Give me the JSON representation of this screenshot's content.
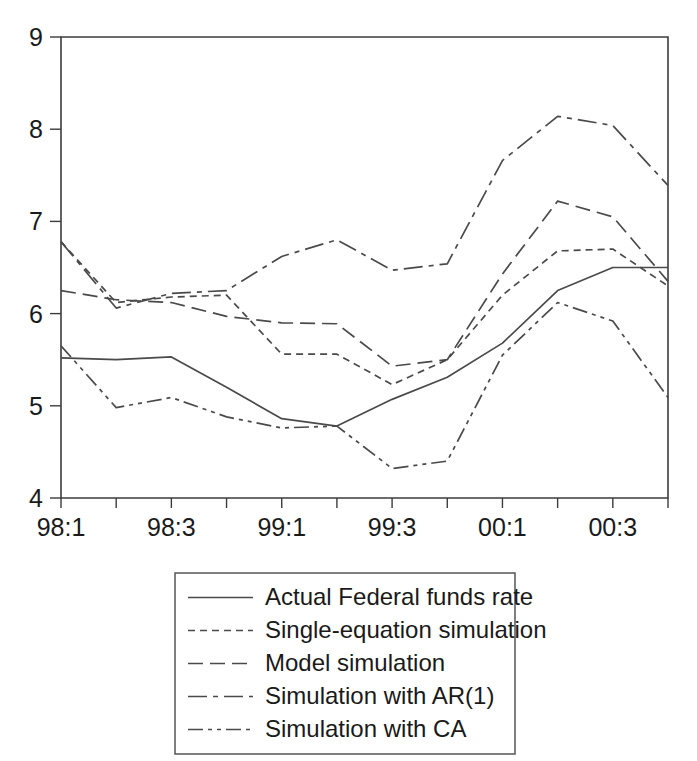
{
  "chart_data": {
    "type": "line",
    "title": "",
    "xlabel": "",
    "ylabel": "",
    "ylim": [
      4,
      9
    ],
    "yticks": [
      4,
      5,
      6,
      7,
      8,
      9
    ],
    "grid": false,
    "legend_position": "below-plot",
    "x": [
      "98:1",
      "98:2",
      "98:3",
      "98:4",
      "99:1",
      "99:2",
      "99:3",
      "99:4",
      "00:1",
      "00:2",
      "00:3",
      "00:4"
    ],
    "xtick_labels": [
      "98:1",
      "",
      "98:3",
      "",
      "99:1",
      "",
      "99:3",
      "",
      "00:1",
      "",
      "00:3",
      ""
    ],
    "series": [
      {
        "name": "Actual Federal funds rate",
        "style": "solid",
        "values": [
          5.52,
          5.5,
          5.53,
          5.2,
          4.86,
          4.78,
          5.07,
          5.31,
          5.68,
          6.25,
          6.5,
          6.5
        ]
      },
      {
        "name": "Single-equation simulation",
        "style": "dotted",
        "values": [
          6.78,
          6.12,
          6.18,
          6.2,
          5.56,
          5.56,
          5.23,
          5.5,
          6.2,
          6.68,
          6.7,
          6.3
        ]
      },
      {
        "name": "Model simulation",
        "style": "dashed",
        "values": [
          6.25,
          6.15,
          6.12,
          5.97,
          5.9,
          5.89,
          5.43,
          5.5,
          6.43,
          7.22,
          7.05,
          6.35
        ]
      },
      {
        "name": "Simulation with AR(1)",
        "style": "dashdot",
        "values": [
          6.78,
          6.06,
          6.22,
          6.25,
          6.62,
          6.8,
          6.47,
          6.54,
          7.66,
          8.14,
          8.04,
          7.39
        ]
      },
      {
        "name": "Simulation with CA",
        "style": "dashdotdot",
        "values": [
          5.65,
          4.98,
          5.09,
          4.88,
          4.76,
          4.78,
          4.32,
          4.4,
          5.55,
          6.12,
          5.92,
          5.09
        ]
      }
    ]
  },
  "legend": {
    "items": [
      {
        "label": "Actual Federal funds rate"
      },
      {
        "label": "Single-equation simulation"
      },
      {
        "label": "Model simulation"
      },
      {
        "label": "Simulation with AR(1)"
      },
      {
        "label": "Simulation with CA"
      }
    ]
  }
}
